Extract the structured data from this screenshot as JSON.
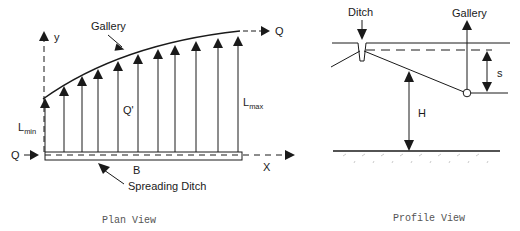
{
  "plan_view": {
    "caption": "Plan View",
    "labels": {
      "y_axis": "y",
      "x_axis": "X",
      "gallery": "Gallery",
      "q_out": "Q",
      "q_in": "Q",
      "q_prime": "Q'",
      "l_min_main": "L",
      "l_min_sub": "min",
      "l_max_main": "L",
      "l_max_sub": "max",
      "b": "B",
      "spreading_ditch": "Spreading Ditch"
    }
  },
  "profile_view": {
    "caption": "Profile View",
    "labels": {
      "ditch": "Ditch",
      "gallery": "Gallery",
      "s": "s",
      "h": "H"
    }
  },
  "colors": {
    "line": "#1a1a1a",
    "caption": "#555555",
    "background": "#ffffff"
  }
}
